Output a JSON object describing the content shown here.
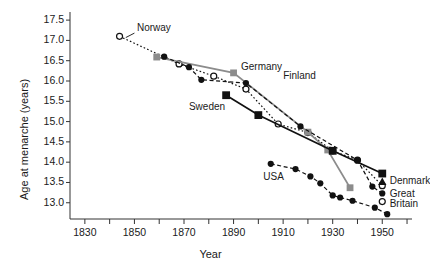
{
  "chart_data": {
    "type": "line",
    "title": "",
    "xlabel": "Year",
    "ylabel": "Age at menarche (years)",
    "xlim": [
      1824,
      1962
    ],
    "ylim": [
      12.6,
      17.7
    ],
    "grid": false,
    "legend_position": "inline-labels",
    "x_ticks": [
      1830,
      1850,
      1870,
      1890,
      1910,
      1930,
      1950
    ],
    "x_tick_labels": [
      "1830",
      "1850",
      "1870",
      "1890",
      "1910",
      "1930",
      "1950"
    ],
    "x_minor_ticks": [
      1840,
      1860,
      1880,
      1900,
      1920,
      1940,
      1960
    ],
    "y_ticks": [
      13.0,
      13.5,
      14.0,
      14.5,
      15.0,
      15.5,
      16.0,
      16.5,
      17.0,
      17.5
    ],
    "y_tick_labels": [
      "13.0",
      "13.5",
      "14.0",
      "14.5",
      "15.0",
      "15.5",
      "16.0",
      "16.5",
      "17.0",
      "17.5"
    ],
    "series": [
      {
        "name": "Norway",
        "label": "Norway",
        "marker": "open-circle",
        "color": "#111111",
        "line": "dotted",
        "label_x": 1851,
        "label_y": 17.28,
        "points": [
          {
            "x": 1844,
            "y": 17.1
          },
          {
            "x": 1868,
            "y": 16.42
          },
          {
            "x": 1882,
            "y": 16.12
          },
          {
            "x": 1895,
            "y": 15.8
          },
          {
            "x": 1908,
            "y": 14.94
          },
          {
            "x": 1920,
            "y": 14.73
          },
          {
            "x": 1930,
            "y": 14.28
          },
          {
            "x": 1940,
            "y": 14.05
          },
          {
            "x": 1950,
            "y": 13.42
          }
        ]
      },
      {
        "name": "Germany",
        "label": "Germany",
        "marker": "gray-square",
        "color": "#8c8c8c",
        "line": "solid-gray",
        "label_x": 1893,
        "label_y": 16.33,
        "points": [
          {
            "x": 1859,
            "y": 16.59
          },
          {
            "x": 1890,
            "y": 16.2
          },
          {
            "x": 1920,
            "y": 14.74
          },
          {
            "x": 1928,
            "y": 14.3
          },
          {
            "x": 1937,
            "y": 13.37
          }
        ]
      },
      {
        "name": "Finland",
        "label": "Finland",
        "marker": "filled-circle",
        "color": "#111111",
        "line": "dashed",
        "label_x": 1910,
        "label_y": 16.1,
        "points": [
          {
            "x": 1862,
            "y": 16.6
          },
          {
            "x": 1872,
            "y": 16.34
          },
          {
            "x": 1877,
            "y": 16.03
          },
          {
            "x": 1895,
            "y": 15.95
          },
          {
            "x": 1917,
            "y": 14.88
          },
          {
            "x": 1940,
            "y": 14.05
          },
          {
            "x": 1946,
            "y": 13.4
          },
          {
            "x": 1950,
            "y": 13.23
          }
        ]
      },
      {
        "name": "Sweden",
        "label": "Sweden",
        "marker": "filled-square",
        "color": "#111111",
        "line": "solid",
        "label_x": 1872,
        "label_y": 15.33,
        "points": [
          {
            "x": 1887,
            "y": 15.65
          },
          {
            "x": 1900,
            "y": 15.16
          },
          {
            "x": 1930,
            "y": 14.28
          },
          {
            "x": 1950,
            "y": 13.72
          }
        ]
      },
      {
        "name": "USA",
        "label": "USA",
        "marker": "filled-circle",
        "color": "#111111",
        "line": "dashed",
        "label_x": 1902,
        "label_y": 13.62,
        "points": [
          {
            "x": 1905,
            "y": 13.96
          },
          {
            "x": 1915,
            "y": 13.83
          },
          {
            "x": 1921,
            "y": 13.65
          },
          {
            "x": 1925,
            "y": 13.48
          },
          {
            "x": 1930,
            "y": 13.18
          },
          {
            "x": 1933,
            "y": 13.13
          },
          {
            "x": 1938,
            "y": 13.05
          },
          {
            "x": 1947,
            "y": 12.88
          },
          {
            "x": 1952,
            "y": 12.72
          }
        ]
      },
      {
        "name": "Denmark",
        "label": "Denmark",
        "marker": "filled-triangle",
        "color": "#111111",
        "line": "none",
        "label_x": 1953,
        "label_y": 13.52,
        "points": [
          {
            "x": 1950,
            "y": 13.52
          }
        ]
      },
      {
        "name": "Great Britain",
        "label": "Great",
        "label2": "Britain",
        "marker": "open-circle",
        "color": "#111111",
        "line": "dotted",
        "label_x": 1953,
        "label_y": 13.2,
        "label2_x": 1953,
        "label2_y": 12.95,
        "points": [
          {
            "x": 1950,
            "y": 13.03
          }
        ]
      }
    ]
  }
}
